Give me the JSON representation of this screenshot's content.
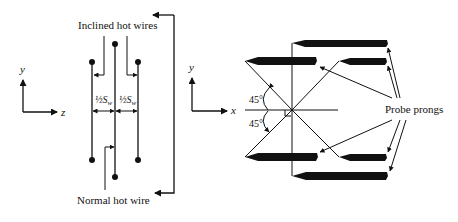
{
  "diagram": {
    "left_view": {
      "axes": {
        "vertical": "y",
        "horizontal": "z"
      },
      "label_inclined": "Inclined hot wires",
      "label_normal": "Normal hot wire",
      "spacing_left": "½S",
      "spacing_right": "½S",
      "spacing_subscript": "w"
    },
    "right_view": {
      "axes": {
        "vertical": "y",
        "horizontal": "x"
      },
      "angle_upper": "45°",
      "angle_lower": "45°",
      "label_prongs": "Probe prongs"
    }
  }
}
